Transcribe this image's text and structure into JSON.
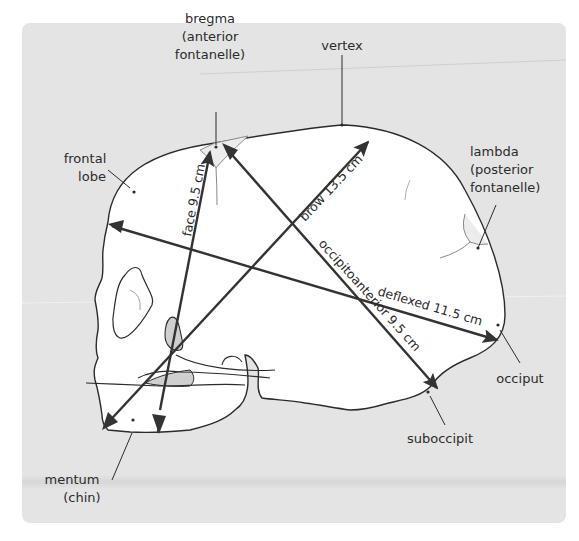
{
  "figure": {
    "colors": {
      "panel_bg": "#e4e4e4",
      "skull_fill": "#ffffff",
      "outline": "#2b2b2b",
      "shaded_bone": "#cfcfcf",
      "arrow": "#333333",
      "text": "#2b2b2b"
    }
  },
  "landmarks": {
    "bregma_line1": "bregma",
    "bregma_line2": "(anterior",
    "bregma_line3": "fontanelle)",
    "vertex": "vertex",
    "frontal_line1": "frontal",
    "frontal_line2": "lobe",
    "lambda_line1": "lambda",
    "lambda_line2": "(posterior",
    "lambda_line3": "fontanelle)",
    "occiput": "occiput",
    "suboccipit": "suboccipit",
    "mentum_line1": "mentum",
    "mentum_line2": "(chin)"
  },
  "diameters": [
    {
      "name": "face",
      "label": "face 9.5 cm",
      "length_cm": 9.5
    },
    {
      "name": "brow",
      "label": "brow 13.5 cm",
      "length_cm": 13.5
    },
    {
      "name": "occipitoanterior",
      "label": "occipitoanterior 9.5 cm",
      "length_cm": 9.5
    },
    {
      "name": "deflexed",
      "label": "deflexed 11.5 cm",
      "length_cm": 11.5
    }
  ]
}
